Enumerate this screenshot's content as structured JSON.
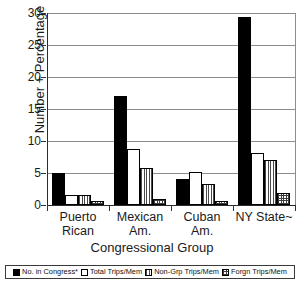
{
  "chart_data": {
    "type": "bar",
    "title": "",
    "xlabel": "Congressional Group",
    "ylabel": "Number + Percentage",
    "ylim": [
      0,
      30
    ],
    "yticks": [
      0,
      5,
      10,
      15,
      20,
      25,
      30
    ],
    "grid": true,
    "legend_position": "bottom",
    "categories": [
      "Puerto Rican",
      "Mexican Am.",
      "Cuban Am.",
      "NY State~"
    ],
    "category_lines": [
      [
        "Puerto",
        "Rican"
      ],
      [
        "Mexican",
        "Am."
      ],
      [
        "Cuban",
        "Am."
      ],
      [
        "NY State~",
        ""
      ]
    ],
    "series": [
      {
        "name": "No. in Congress*",
        "pattern": "solid-black",
        "values": [
          5.0,
          17.1,
          4.1,
          29.3
        ]
      },
      {
        "name": "Total Trips/Mem",
        "pattern": "solid-white",
        "values": [
          1.5,
          8.8,
          5.1,
          8.1
        ]
      },
      {
        "name": "Non-Grp Trips/Mem",
        "pattern": "vertical-lines",
        "values": [
          1.6,
          5.8,
          3.3,
          7.0
        ]
      },
      {
        "name": "Forgn Trips/Mem",
        "pattern": "cross-dots",
        "values": [
          0.7,
          0.9,
          0.7,
          1.9
        ]
      }
    ]
  },
  "legend": {
    "items": [
      {
        "label": "No. in Congress*"
      },
      {
        "label": "Total Trips/Mem"
      },
      {
        "label": "Non-Grp Trips/Mem"
      },
      {
        "label": "Forgn Trips/Mem"
      }
    ]
  }
}
